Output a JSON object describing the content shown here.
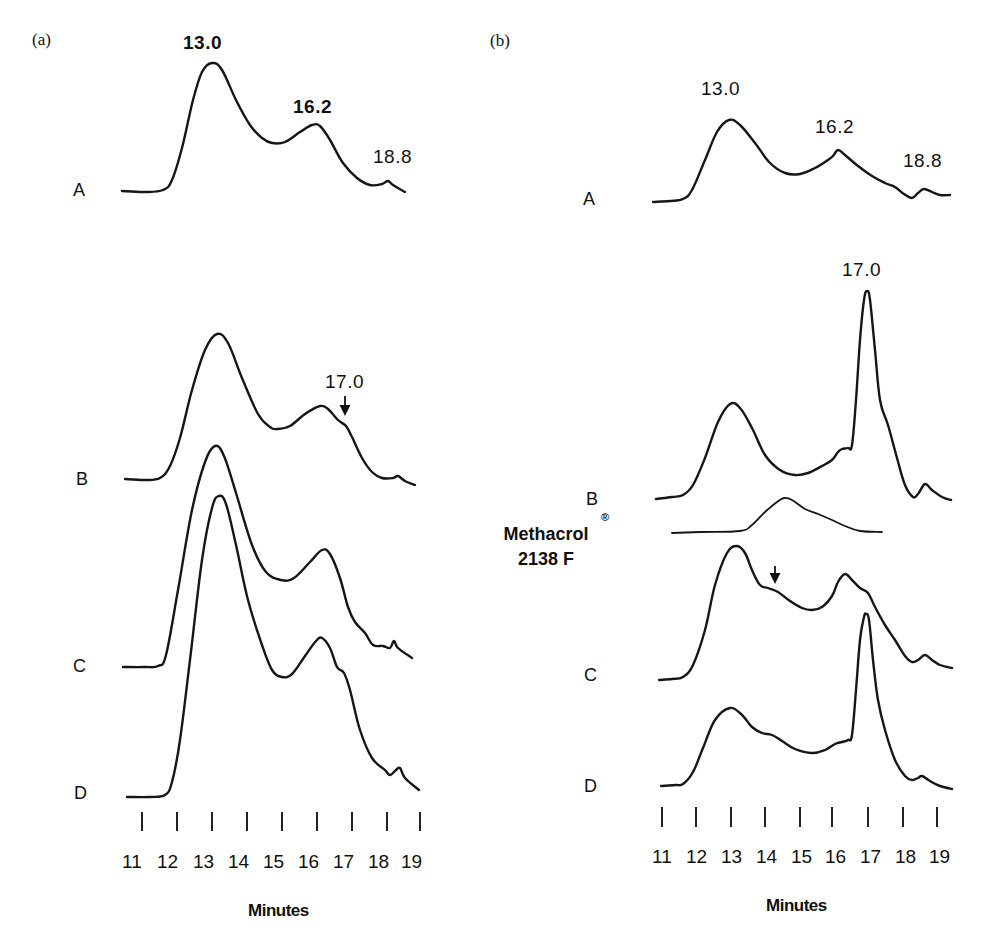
{
  "figure": {
    "panels": [
      {
        "tag": "(a)",
        "peak_labels": [
          "13.0",
          "16.2",
          "18.8",
          "17.0"
        ],
        "trace_labels": [
          "A",
          "B",
          "C",
          "D"
        ],
        "ticks": [
          "11",
          "12",
          "13",
          "14",
          "15",
          "16",
          "17",
          "18",
          "19"
        ],
        "xlabel": "Minutes"
      },
      {
        "tag": "(b)",
        "peak_labels": [
          "13.0",
          "16.2",
          "18.8",
          "17.0"
        ],
        "trace_labels": [
          "A",
          "B",
          "C",
          "D"
        ],
        "compound_line1": "Methacrol",
        "compound_line2": "2138 F",
        "registered": "®",
        "ticks": [
          "11",
          "12",
          "13",
          "14",
          "15",
          "16",
          "17",
          "18",
          "19"
        ],
        "xlabel": "Minutes"
      }
    ]
  },
  "chart_data": [
    {
      "type": "line",
      "title": "(a)",
      "xlabel": "Minutes",
      "ylabel": "",
      "xlim": [
        11,
        19
      ],
      "x_ticks": [
        11,
        12,
        13,
        14,
        15,
        16,
        17,
        18,
        19
      ],
      "grid": false,
      "annotations": [
        {
          "text": "13.0",
          "trace": "A",
          "x": 13.0
        },
        {
          "text": "16.2",
          "trace": "A",
          "x": 16.2
        },
        {
          "text": "18.8",
          "trace": "A",
          "x": 18.8
        },
        {
          "text": "17.0",
          "trace": "B",
          "x": 17.0,
          "arrow": true
        }
      ],
      "series": [
        {
          "name": "A",
          "peaks_min": [
            13.0,
            16.2,
            18.8
          ],
          "relative_heights": [
            1.0,
            0.52,
            0.06
          ]
        },
        {
          "name": "B",
          "peaks_min": [
            13.1,
            16.1,
            17.0,
            18.4
          ],
          "relative_heights": [
            1.0,
            0.5,
            0.36,
            0.02
          ]
        },
        {
          "name": "C",
          "peaks_min": [
            13.1,
            16.2,
            18.2
          ],
          "relative_heights": [
            1.0,
            0.53,
            0.1
          ]
        },
        {
          "name": "D",
          "peaks_min": [
            13.3,
            16.1,
            16.8,
            18.4
          ],
          "relative_heights": [
            1.0,
            0.51,
            0.4,
            0.1
          ]
        }
      ]
    },
    {
      "type": "line",
      "title": "(b)",
      "xlabel": "Minutes",
      "ylabel": "",
      "xlim": [
        11,
        19
      ],
      "x_ticks": [
        11,
        12,
        13,
        14,
        15,
        16,
        17,
        18,
        19
      ],
      "grid": false,
      "annotations": [
        {
          "text": "13.0",
          "trace": "A",
          "x": 13.0
        },
        {
          "text": "16.2",
          "trace": "A",
          "x": 16.2
        },
        {
          "text": "18.8",
          "trace": "A",
          "x": 18.8
        },
        {
          "text": "17.0",
          "trace": "B",
          "x": 17.0
        },
        {
          "text": "Methacrol® 2138 F",
          "trace": "Methacrol 2138 F",
          "x": 14.5
        },
        {
          "text": "↓",
          "trace": "C",
          "x": 14.3,
          "arrow": true
        }
      ],
      "series": [
        {
          "name": "A",
          "peaks_min": [
            13.0,
            16.2,
            18.8
          ],
          "relative_heights": [
            1.0,
            0.62,
            0.16
          ]
        },
        {
          "name": "B",
          "peaks_min": [
            13.0,
            17.0,
            18.6
          ],
          "relative_heights": [
            0.45,
            1.0,
            0.07
          ]
        },
        {
          "name": "Methacrol 2138 F",
          "peaks_min": [
            14.6
          ],
          "relative_heights": [
            1.0
          ]
        },
        {
          "name": "C",
          "peaks_min": [
            13.2,
            14.3,
            16.3,
            18.6
          ],
          "relative_heights": [
            1.0,
            0.7,
            0.78,
            0.1
          ]
        },
        {
          "name": "D",
          "peaks_min": [
            13.0,
            14.3,
            16.9,
            18.6
          ],
          "relative_heights": [
            0.46,
            0.3,
            1.0,
            0.06
          ]
        }
      ]
    }
  ],
  "traces_px": {
    "a_A": [
      [
        122,
        191
      ],
      [
        145,
        192
      ],
      [
        163,
        190
      ],
      [
        172,
        180
      ],
      [
        182,
        148
      ],
      [
        193,
        100
      ],
      [
        202,
        72
      ],
      [
        212,
        63
      ],
      [
        222,
        70
      ],
      [
        236,
        100
      ],
      [
        250,
        125
      ],
      [
        262,
        138
      ],
      [
        272,
        143
      ],
      [
        285,
        142
      ],
      [
        300,
        132
      ],
      [
        312,
        125
      ],
      [
        320,
        126
      ],
      [
        330,
        140
      ],
      [
        343,
        163
      ],
      [
        357,
        178
      ],
      [
        370,
        185
      ],
      [
        382,
        184
      ],
      [
        388,
        181
      ],
      [
        393,
        185
      ],
      [
        405,
        192
      ]
    ],
    "a_B": [
      [
        125,
        479
      ],
      [
        145,
        480
      ],
      [
        160,
        478
      ],
      [
        170,
        466
      ],
      [
        180,
        438
      ],
      [
        192,
        390
      ],
      [
        205,
        350
      ],
      [
        217,
        334
      ],
      [
        228,
        343
      ],
      [
        242,
        378
      ],
      [
        258,
        414
      ],
      [
        270,
        427
      ],
      [
        277,
        429
      ],
      [
        290,
        426
      ],
      [
        305,
        414
      ],
      [
        320,
        406
      ],
      [
        328,
        409
      ],
      [
        338,
        420
      ],
      [
        346,
        426
      ],
      [
        352,
        437
      ],
      [
        362,
        458
      ],
      [
        372,
        472
      ],
      [
        382,
        478
      ],
      [
        393,
        478
      ],
      [
        398,
        476
      ],
      [
        405,
        481
      ],
      [
        415,
        485
      ]
    ],
    "a_C": [
      [
        123,
        667
      ],
      [
        145,
        667
      ],
      [
        158,
        666
      ],
      [
        166,
        655
      ],
      [
        178,
        590
      ],
      [
        192,
        510
      ],
      [
        205,
        462
      ],
      [
        215,
        446
      ],
      [
        224,
        456
      ],
      [
        236,
        493
      ],
      [
        252,
        545
      ],
      [
        266,
        572
      ],
      [
        281,
        580
      ],
      [
        294,
        578
      ],
      [
        310,
        562
      ],
      [
        322,
        550
      ],
      [
        330,
        554
      ],
      [
        340,
        578
      ],
      [
        348,
        607
      ],
      [
        355,
        622
      ],
      [
        365,
        633
      ],
      [
        373,
        645
      ],
      [
        383,
        646
      ],
      [
        390,
        648
      ],
      [
        394,
        641
      ],
      [
        398,
        648
      ],
      [
        412,
        658
      ]
    ],
    "a_D": [
      [
        127,
        797
      ],
      [
        150,
        797
      ],
      [
        165,
        795
      ],
      [
        172,
        782
      ],
      [
        180,
        740
      ],
      [
        190,
        660
      ],
      [
        202,
        560
      ],
      [
        212,
        508
      ],
      [
        219,
        496
      ],
      [
        226,
        504
      ],
      [
        236,
        545
      ],
      [
        248,
        600
      ],
      [
        262,
        645
      ],
      [
        272,
        670
      ],
      [
        282,
        677
      ],
      [
        292,
        674
      ],
      [
        305,
        656
      ],
      [
        316,
        641
      ],
      [
        322,
        638
      ],
      [
        330,
        648
      ],
      [
        337,
        667
      ],
      [
        344,
        673
      ],
      [
        350,
        690
      ],
      [
        360,
        730
      ],
      [
        372,
        758
      ],
      [
        385,
        770
      ],
      [
        390,
        775
      ],
      [
        396,
        770
      ],
      [
        400,
        768
      ],
      [
        405,
        778
      ],
      [
        419,
        790
      ]
    ],
    "b_A": [
      [
        653,
        202
      ],
      [
        670,
        201
      ],
      [
        683,
        199
      ],
      [
        692,
        190
      ],
      [
        705,
        160
      ],
      [
        717,
        132
      ],
      [
        729,
        120
      ],
      [
        740,
        125
      ],
      [
        755,
        143
      ],
      [
        770,
        163
      ],
      [
        785,
        173
      ],
      [
        800,
        174
      ],
      [
        815,
        168
      ],
      [
        828,
        160
      ],
      [
        833,
        156
      ],
      [
        838,
        150
      ],
      [
        845,
        155
      ],
      [
        858,
        166
      ],
      [
        872,
        176
      ],
      [
        885,
        183
      ],
      [
        895,
        187
      ],
      [
        904,
        194
      ],
      [
        912,
        198
      ],
      [
        918,
        193
      ],
      [
        924,
        189
      ],
      [
        932,
        192
      ],
      [
        940,
        195
      ],
      [
        950,
        195
      ]
    ],
    "b_A_dummy": [],
    "b_B": [
      [
        656,
        499
      ],
      [
        672,
        497
      ],
      [
        683,
        495
      ],
      [
        693,
        485
      ],
      [
        705,
        458
      ],
      [
        718,
        422
      ],
      [
        730,
        404
      ],
      [
        740,
        408
      ],
      [
        752,
        428
      ],
      [
        765,
        455
      ],
      [
        780,
        470
      ],
      [
        795,
        475
      ],
      [
        808,
        473
      ],
      [
        822,
        466
      ],
      [
        832,
        460
      ],
      [
        838,
        452
      ],
      [
        842,
        449
      ],
      [
        848,
        448
      ],
      [
        852,
        445
      ],
      [
        856,
        400
      ],
      [
        860,
        340
      ],
      [
        864,
        300
      ],
      [
        867,
        291
      ],
      [
        870,
        300
      ],
      [
        875,
        350
      ],
      [
        880,
        400
      ],
      [
        888,
        425
      ],
      [
        897,
        458
      ],
      [
        905,
        485
      ],
      [
        913,
        497
      ],
      [
        918,
        494
      ],
      [
        925,
        484
      ],
      [
        932,
        490
      ],
      [
        942,
        497
      ],
      [
        951,
        500
      ]
    ],
    "b_M": [
      [
        672,
        533
      ],
      [
        700,
        532
      ],
      [
        740,
        531
      ],
      [
        752,
        525
      ],
      [
        765,
        512
      ],
      [
        777,
        502
      ],
      [
        784,
        498
      ],
      [
        792,
        500
      ],
      [
        805,
        509
      ],
      [
        818,
        514
      ],
      [
        832,
        520
      ],
      [
        845,
        526
      ],
      [
        860,
        531
      ],
      [
        882,
        532
      ]
    ],
    "b_C": [
      [
        659,
        680
      ],
      [
        672,
        679
      ],
      [
        683,
        677
      ],
      [
        693,
        665
      ],
      [
        705,
        630
      ],
      [
        715,
        585
      ],
      [
        727,
        553
      ],
      [
        737,
        546
      ],
      [
        745,
        553
      ],
      [
        752,
        570
      ],
      [
        760,
        585
      ],
      [
        768,
        588
      ],
      [
        778,
        592
      ],
      [
        790,
        601
      ],
      [
        802,
        608
      ],
      [
        812,
        610
      ],
      [
        822,
        607
      ],
      [
        832,
        596
      ],
      [
        838,
        582
      ],
      [
        845,
        574
      ],
      [
        852,
        580
      ],
      [
        860,
        588
      ],
      [
        868,
        593
      ],
      [
        875,
        607
      ],
      [
        885,
        625
      ],
      [
        895,
        640
      ],
      [
        905,
        656
      ],
      [
        912,
        662
      ],
      [
        918,
        660
      ],
      [
        925,
        655
      ],
      [
        932,
        660
      ],
      [
        940,
        665
      ],
      [
        952,
        668
      ]
    ],
    "b_D": [
      [
        661,
        786
      ],
      [
        675,
        785
      ],
      [
        683,
        784
      ],
      [
        693,
        772
      ],
      [
        703,
        748
      ],
      [
        715,
        720
      ],
      [
        730,
        708
      ],
      [
        742,
        715
      ],
      [
        752,
        727
      ],
      [
        762,
        733
      ],
      [
        772,
        735
      ],
      [
        782,
        741
      ],
      [
        795,
        749
      ],
      [
        812,
        753
      ],
      [
        825,
        750
      ],
      [
        835,
        744
      ],
      [
        842,
        742
      ],
      [
        848,
        740
      ],
      [
        852,
        735
      ],
      [
        856,
        690
      ],
      [
        860,
        640
      ],
      [
        864,
        617
      ],
      [
        866,
        614
      ],
      [
        869,
        620
      ],
      [
        873,
        660
      ],
      [
        878,
        700
      ],
      [
        885,
        730
      ],
      [
        895,
        760
      ],
      [
        905,
        776
      ],
      [
        912,
        780
      ],
      [
        918,
        778
      ],
      [
        922,
        776
      ],
      [
        930,
        781
      ],
      [
        940,
        786
      ],
      [
        952,
        789
      ]
    ]
  },
  "tick_px": {
    "a": {
      "x": [
        142,
        177,
        212,
        247,
        282,
        317,
        352,
        387,
        420
      ],
      "y1": 812,
      "y2": 831
    },
    "b": {
      "x": [
        662,
        696,
        731,
        765,
        800,
        832,
        868,
        903,
        937
      ],
      "y1": 807,
      "y2": 827
    }
  }
}
